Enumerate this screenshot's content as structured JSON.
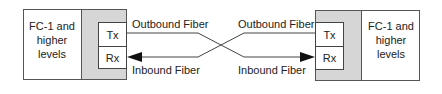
{
  "left_node": {
    "label_lines": [
      "FC-1 and",
      "higher",
      "levels"
    ],
    "ports": {
      "tx": "Tx",
      "rx": "Rx"
    }
  },
  "right_node": {
    "label_lines": [
      "FC-1 and",
      "higher",
      "levels"
    ],
    "ports": {
      "tx": "Tx",
      "rx": "Rx"
    }
  },
  "fibers": {
    "left_outbound": "Outbound Fiber",
    "left_inbound": "Inbound Fiber",
    "right_outbound": "Outbound Fiber",
    "right_inbound": "Inbound Fiber"
  },
  "colors": {
    "panel_gray": "#d6d6d6",
    "stroke": "#444444"
  }
}
